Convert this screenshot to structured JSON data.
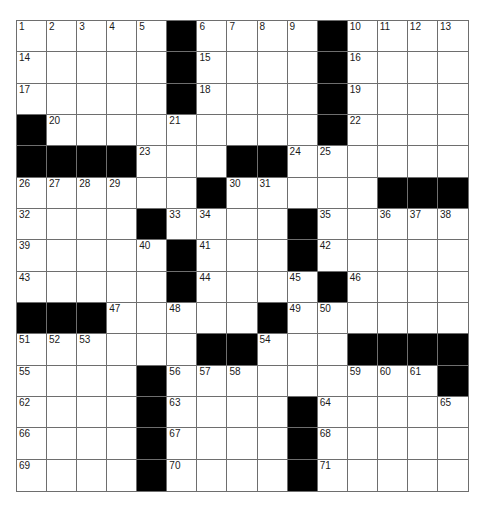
{
  "puzzle": {
    "rows": 15,
    "cols": 15,
    "colors": {
      "block": "#000000",
      "cell": "#ffffff",
      "grid_line": "#6e6e6e",
      "number": "#1a1a1a"
    },
    "layout": [
      ".....#....#....",
      ".....#....#....",
      ".....#....#....",
      "#.........#....",
      "####...##......",
      "......#.....###",
      "....#....#.....",
      ".....#...#.....",
      ".....#....#....",
      "###.....#......",
      "......##...####",
      "....#.........#",
      "....#....#.....",
      "....#....#.....",
      "....#....#....."
    ],
    "numbers": [
      {
        "r": 0,
        "c": 0,
        "n": "1"
      },
      {
        "r": 0,
        "c": 1,
        "n": "2"
      },
      {
        "r": 0,
        "c": 2,
        "n": "3"
      },
      {
        "r": 0,
        "c": 3,
        "n": "4"
      },
      {
        "r": 0,
        "c": 4,
        "n": "5"
      },
      {
        "r": 0,
        "c": 6,
        "n": "6"
      },
      {
        "r": 0,
        "c": 7,
        "n": "7"
      },
      {
        "r": 0,
        "c": 8,
        "n": "8"
      },
      {
        "r": 0,
        "c": 9,
        "n": "9"
      },
      {
        "r": 0,
        "c": 11,
        "n": "10"
      },
      {
        "r": 0,
        "c": 12,
        "n": "11"
      },
      {
        "r": 0,
        "c": 13,
        "n": "12"
      },
      {
        "r": 0,
        "c": 14,
        "n": "13"
      },
      {
        "r": 1,
        "c": 0,
        "n": "14"
      },
      {
        "r": 1,
        "c": 6,
        "n": "15"
      },
      {
        "r": 1,
        "c": 11,
        "n": "16"
      },
      {
        "r": 2,
        "c": 0,
        "n": "17"
      },
      {
        "r": 2,
        "c": 6,
        "n": "18"
      },
      {
        "r": 2,
        "c": 11,
        "n": "19"
      },
      {
        "r": 3,
        "c": 1,
        "n": "20"
      },
      {
        "r": 3,
        "c": 5,
        "n": "21"
      },
      {
        "r": 3,
        "c": 11,
        "n": "22"
      },
      {
        "r": 4,
        "c": 4,
        "n": "23"
      },
      {
        "r": 4,
        "c": 9,
        "n": "24"
      },
      {
        "r": 4,
        "c": 10,
        "n": "25"
      },
      {
        "r": 5,
        "c": 0,
        "n": "26"
      },
      {
        "r": 5,
        "c": 1,
        "n": "27"
      },
      {
        "r": 5,
        "c": 2,
        "n": "28"
      },
      {
        "r": 5,
        "c": 3,
        "n": "29"
      },
      {
        "r": 5,
        "c": 7,
        "n": "30"
      },
      {
        "r": 5,
        "c": 8,
        "n": "31"
      },
      {
        "r": 6,
        "c": 0,
        "n": "32"
      },
      {
        "r": 6,
        "c": 5,
        "n": "33"
      },
      {
        "r": 6,
        "c": 6,
        "n": "34"
      },
      {
        "r": 6,
        "c": 10,
        "n": "35"
      },
      {
        "r": 6,
        "c": 12,
        "n": "36"
      },
      {
        "r": 6,
        "c": 13,
        "n": "37"
      },
      {
        "r": 6,
        "c": 14,
        "n": "38"
      },
      {
        "r": 7,
        "c": 0,
        "n": "39"
      },
      {
        "r": 7,
        "c": 4,
        "n": "40"
      },
      {
        "r": 7,
        "c": 6,
        "n": "41"
      },
      {
        "r": 7,
        "c": 10,
        "n": "42"
      },
      {
        "r": 8,
        "c": 0,
        "n": "43"
      },
      {
        "r": 8,
        "c": 6,
        "n": "44"
      },
      {
        "r": 8,
        "c": 9,
        "n": "45"
      },
      {
        "r": 8,
        "c": 11,
        "n": "46"
      },
      {
        "r": 9,
        "c": 3,
        "n": "47"
      },
      {
        "r": 9,
        "c": 5,
        "n": "48"
      },
      {
        "r": 9,
        "c": 9,
        "n": "49"
      },
      {
        "r": 9,
        "c": 10,
        "n": "50"
      },
      {
        "r": 10,
        "c": 0,
        "n": "51"
      },
      {
        "r": 10,
        "c": 1,
        "n": "52"
      },
      {
        "r": 10,
        "c": 2,
        "n": "53"
      },
      {
        "r": 10,
        "c": 8,
        "n": "54"
      },
      {
        "r": 11,
        "c": 0,
        "n": "55"
      },
      {
        "r": 11,
        "c": 5,
        "n": "56"
      },
      {
        "r": 11,
        "c": 6,
        "n": "57"
      },
      {
        "r": 11,
        "c": 7,
        "n": "58"
      },
      {
        "r": 11,
        "c": 11,
        "n": "59"
      },
      {
        "r": 11,
        "c": 12,
        "n": "60"
      },
      {
        "r": 11,
        "c": 13,
        "n": "61"
      },
      {
        "r": 12,
        "c": 0,
        "n": "62"
      },
      {
        "r": 12,
        "c": 5,
        "n": "63"
      },
      {
        "r": 12,
        "c": 10,
        "n": "64"
      },
      {
        "r": 12,
        "c": 14,
        "n": "65"
      },
      {
        "r": 13,
        "c": 0,
        "n": "66"
      },
      {
        "r": 13,
        "c": 5,
        "n": "67"
      },
      {
        "r": 13,
        "c": 10,
        "n": "68"
      },
      {
        "r": 14,
        "c": 0,
        "n": "69"
      },
      {
        "r": 14,
        "c": 5,
        "n": "70"
      },
      {
        "r": 14,
        "c": 10,
        "n": "71"
      }
    ],
    "entries": []
  }
}
